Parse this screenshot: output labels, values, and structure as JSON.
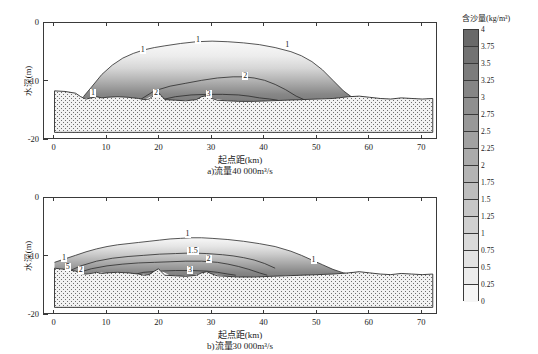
{
  "figure": {
    "xlabel": "起点距(km)",
    "ylabel": "水深(m)",
    "panel_a_caption": "a)流量40 000m³/s",
    "panel_b_caption": "b)流量30 000m³/s"
  },
  "colorbar": {
    "title": "含沙量(kg/m³)",
    "ticks": [
      "4",
      "3.75",
      "3.5",
      "3.25",
      "3",
      "2.75",
      "2.5",
      "2.25",
      "2",
      "1.75",
      "1.5",
      "1.25",
      "1",
      "0.75",
      "0.5",
      "0.25",
      "0"
    ],
    "min": 0,
    "max": 4,
    "step": 0.25
  },
  "axes": {
    "xticks": [
      "0",
      "10",
      "20",
      "30",
      "40",
      "50",
      "60",
      "70"
    ],
    "xvalues": [
      0,
      10,
      20,
      30,
      40,
      50,
      60,
      70
    ],
    "xlim": [
      -2,
      73
    ],
    "yticks": [
      "0",
      "-10",
      "-20"
    ],
    "yvalues": [
      0,
      -10,
      -20
    ],
    "ylim": [
      -20,
      0
    ]
  },
  "chart_data": {
    "type": "heatmap",
    "title": "",
    "xlabel": "起点距(km)",
    "ylabel": "水深(m)",
    "zlabel": "含沙量(kg/m³)",
    "xlim": [
      -2,
      73
    ],
    "ylim": [
      -20,
      0
    ],
    "zlim": [
      0,
      4
    ],
    "grid": false,
    "legend": "colorbar-right",
    "panels": [
      {
        "id": "a",
        "caption": "a)流量40 000m³/s",
        "discharge": "40 000m³/s",
        "contour_labels": [
          {
            "value": "1",
            "x": 7.5,
            "y": -12.2
          },
          {
            "value": "1",
            "x": 17.0,
            "y": -4.8
          },
          {
            "value": "1",
            "x": 27.5,
            "y": -3.0
          },
          {
            "value": "1",
            "x": 44.5,
            "y": -4.0
          },
          {
            "value": "2",
            "x": 36.5,
            "y": -9.2
          },
          {
            "value": "2",
            "x": 19.5,
            "y": -12.2
          },
          {
            "value": "3",
            "x": 29.5,
            "y": -12.3
          }
        ],
        "bed_profile_x": [
          0,
          2,
          4,
          5,
          6,
          7,
          8,
          9,
          10,
          12,
          14,
          16,
          17,
          18,
          19,
          19.8,
          20.3,
          21,
          23,
          25,
          27,
          28,
          29,
          30,
          31,
          33,
          35,
          38,
          41,
          44,
          47,
          50,
          53,
          56,
          58,
          60,
          62,
          64,
          66,
          68,
          70,
          72
        ],
        "bed_profile_y": [
          -11.6,
          -11.7,
          -12.0,
          -12.6,
          -13.0,
          -12.8,
          -12.6,
          -12.8,
          -12.7,
          -12.6,
          -12.7,
          -12.9,
          -13.1,
          -13.0,
          -12.3,
          -11.9,
          -12.4,
          -13.1,
          -13.2,
          -13.3,
          -13.1,
          -12.6,
          -12.4,
          -12.9,
          -13.2,
          -13.3,
          -13.4,
          -13.4,
          -13.3,
          -13.2,
          -13.1,
          -13.0,
          -12.9,
          -12.6,
          -12.5,
          -12.7,
          -12.9,
          -13.0,
          -12.8,
          -12.9,
          -13.0,
          -12.9
        ],
        "plume_top_x": [
          5.5,
          7,
          9,
          11,
          13,
          15,
          17,
          19,
          21,
          24,
          27,
          30,
          33,
          36,
          39,
          42,
          45,
          47,
          49,
          51,
          53,
          55,
          56.5,
          57.5
        ],
        "plume_top_y": [
          -12.6,
          -11.0,
          -8.8,
          -7.2,
          -6.0,
          -5.2,
          -4.6,
          -4.2,
          -3.9,
          -3.5,
          -3.2,
          -3.1,
          -3.2,
          -3.4,
          -3.7,
          -4.2,
          -4.9,
          -5.6,
          -6.6,
          -8.0,
          -9.8,
          -11.6,
          -12.6,
          -13.1
        ],
        "contour_2_x": [
          16.5,
          19,
          22,
          25,
          28,
          31,
          34,
          36,
          38,
          40,
          42,
          44,
          46,
          47.5
        ],
        "contour_2_y": [
          -13.0,
          -11.6,
          -10.8,
          -10.3,
          -9.8,
          -9.4,
          -9.2,
          -9.2,
          -9.4,
          -9.8,
          -10.5,
          -11.4,
          -12.5,
          -13.1
        ],
        "contour_3_x": [
          20.5,
          23,
          26,
          29,
          32,
          35,
          37,
          39,
          41,
          42.5
        ],
        "contour_3_y": [
          -13.1,
          -12.6,
          -12.3,
          -12.2,
          -12.2,
          -12.3,
          -12.5,
          -12.8,
          -13.0,
          -13.2
        ],
        "max_concentration_estimate": 3.5,
        "max_concentration_location_km": 33
      },
      {
        "id": "b",
        "caption": "b)流量30 000m³/s",
        "discharge": "30 000m³/s",
        "contour_labels": [
          {
            "value": "1",
            "x": 2.0,
            "y": -10.5
          },
          {
            "value": "1",
            "x": 25.5,
            "y": -6.4
          },
          {
            "value": "1",
            "x": 49.5,
            "y": -10.8
          },
          {
            "value": "1.5",
            "x": 26.5,
            "y": -9.3
          },
          {
            "value": "2",
            "x": 29.5,
            "y": -10.6
          },
          {
            "value": "2",
            "x": 5.2,
            "y": -12.4
          },
          {
            "value": "5",
            "x": 2.7,
            "y": -11.9
          },
          {
            "value": "3",
            "x": 26.0,
            "y": -12.4
          }
        ],
        "bed_profile_x": [
          0,
          2,
          4,
          5,
          6,
          7,
          8,
          9,
          10,
          12,
          14,
          16,
          17,
          18,
          19,
          19.8,
          20.3,
          21,
          23,
          25,
          27,
          28,
          29,
          30,
          31,
          33,
          35,
          38,
          41,
          44,
          47,
          50,
          53,
          56,
          58,
          60,
          62,
          64,
          66,
          68,
          70,
          72
        ],
        "bed_profile_y": [
          -12.0,
          -12.2,
          -12.5,
          -12.9,
          -13.0,
          -12.9,
          -12.7,
          -12.9,
          -12.8,
          -12.7,
          -12.8,
          -13.0,
          -13.2,
          -13.1,
          -12.5,
          -12.1,
          -12.6,
          -13.2,
          -13.3,
          -13.4,
          -13.2,
          -12.8,
          -12.6,
          -13.0,
          -13.3,
          -13.4,
          -13.5,
          -13.5,
          -13.4,
          -13.3,
          -13.2,
          -13.1,
          -13.0,
          -12.8,
          -12.6,
          -12.8,
          -13.0,
          -13.1,
          -12.9,
          -13.0,
          -13.1,
          -13.0
        ],
        "plume_top_x": [
          0,
          2,
          4,
          6,
          8,
          10,
          12,
          14,
          16,
          18,
          20,
          22,
          24,
          26,
          28,
          30,
          33,
          36,
          39,
          42,
          45,
          47,
          49,
          51,
          53,
          55,
          56.5,
          58
        ],
        "plume_top_y": [
          -11.0,
          -10.4,
          -9.8,
          -9.2,
          -8.7,
          -8.3,
          -8.0,
          -7.8,
          -7.6,
          -7.4,
          -7.2,
          -7.0,
          -6.9,
          -6.8,
          -6.8,
          -6.9,
          -7.1,
          -7.4,
          -7.8,
          -8.3,
          -9.1,
          -9.8,
          -10.6,
          -11.4,
          -12.2,
          -12.8,
          -13.1,
          -13.3
        ],
        "contour_15_x": [
          2.5,
          5,
          8,
          11,
          14,
          17,
          20,
          23,
          26,
          29,
          32,
          34,
          36,
          38,
          40,
          42
        ],
        "contour_15_y": [
          -12.6,
          -11.6,
          -10.8,
          -10.3,
          -10.0,
          -9.8,
          -9.6,
          -9.5,
          -9.4,
          -9.5,
          -9.7,
          -9.9,
          -10.2,
          -10.6,
          -11.2,
          -12.0
        ],
        "contour_2_x": [
          4.0,
          7,
          10,
          13,
          16,
          19,
          22,
          25,
          28,
          31,
          33,
          35,
          37,
          39,
          40.5
        ],
        "contour_2_y": [
          -12.9,
          -12.1,
          -11.6,
          -11.3,
          -11.1,
          -11.0,
          -10.9,
          -10.8,
          -10.8,
          -11.0,
          -11.3,
          -11.7,
          -12.2,
          -12.8,
          -13.2
        ],
        "contour_3_x": [
          14.5,
          17,
          20,
          23,
          26,
          29,
          31,
          33,
          34.5
        ],
        "contour_3_y": [
          -13.2,
          -12.7,
          -12.5,
          -12.4,
          -12.4,
          -12.5,
          -12.7,
          -13.0,
          -13.2
        ],
        "max_concentration_estimate": 3.5,
        "max_concentration_location_km": 25
      }
    ]
  }
}
